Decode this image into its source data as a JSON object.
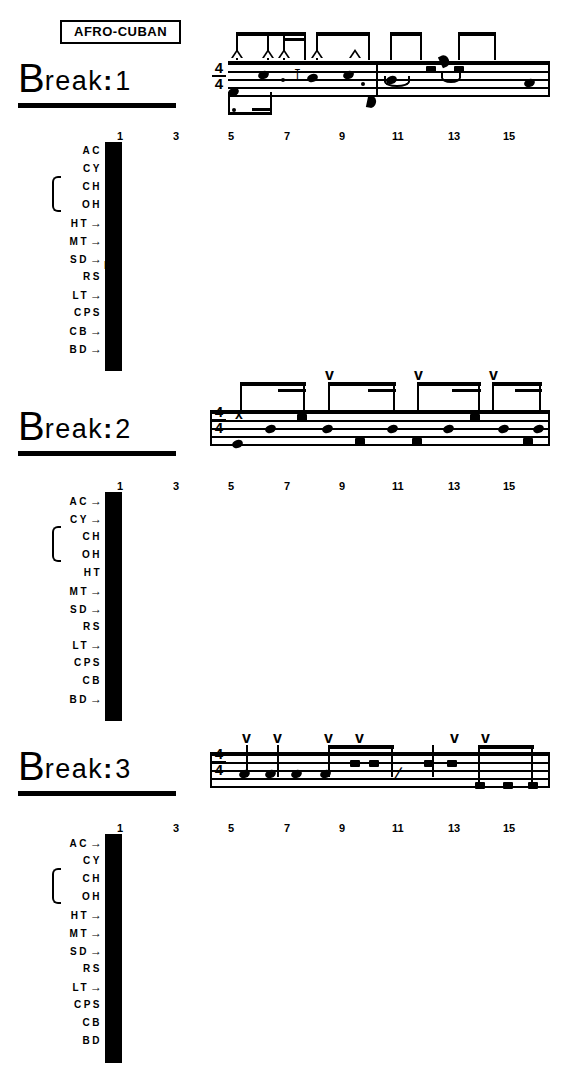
{
  "document": {
    "style_banner": "AFRO-CUBAN"
  },
  "grid": {
    "column_numbers": [
      "1",
      "3",
      "5",
      "7",
      "9",
      "11",
      "13",
      "15"
    ],
    "column_count": 16,
    "row_labels": [
      "AC",
      "CY",
      "CH",
      "OH",
      "HT",
      "MT",
      "SD",
      "RS",
      "LT",
      "CPS",
      "CB",
      "BD"
    ],
    "flam_marker": "F"
  },
  "breaks": [
    {
      "id": "break-1",
      "label_b": "B",
      "label_rest": "reak",
      "label_colon": ":",
      "label_number": "1",
      "time_signature": {
        "top": "4",
        "bottom": "4"
      },
      "rows": [
        {
          "label": "AC",
          "arrow": false,
          "cells": []
        },
        {
          "label": "CY",
          "arrow": false,
          "cells": []
        },
        {
          "label": "CH",
          "arrow": false,
          "cells": []
        },
        {
          "label": "OH",
          "arrow": false,
          "cells": []
        },
        {
          "label": "HT",
          "arrow": true,
          "cells": [
            13
          ],
          "flams": [
            13
          ]
        },
        {
          "label": "MT",
          "arrow": true,
          "cells": [
            11
          ]
        },
        {
          "label": "SD",
          "arrow": true,
          "cells": [
            4,
            7,
            9
          ],
          "flams": [
            9
          ]
        },
        {
          "label": "RS",
          "arrow": false,
          "cells": []
        },
        {
          "label": "LT",
          "arrow": true,
          "cells": [
            15
          ]
        },
        {
          "label": "CPS",
          "arrow": false,
          "cells": []
        },
        {
          "label": "CB",
          "arrow": true,
          "cells": [
            1,
            3,
            4,
            5,
            7
          ]
        },
        {
          "label": "BD",
          "arrow": true,
          "cells": [
            1
          ]
        }
      ]
    },
    {
      "id": "break-2",
      "label_b": "B",
      "label_rest": "reak",
      "label_colon": ":",
      "label_number": "2",
      "time_signature": {
        "top": "4",
        "bottom": "4"
      },
      "rows": [
        {
          "label": "AC",
          "arrow": true,
          "cells": [
            5,
            9,
            13
          ]
        },
        {
          "label": "CY",
          "arrow": true,
          "cells": [
            1
          ]
        },
        {
          "label": "CH",
          "arrow": false,
          "cells": []
        },
        {
          "label": "OH",
          "arrow": false,
          "cells": []
        },
        {
          "label": "HT",
          "arrow": false,
          "cells": []
        },
        {
          "label": "MT",
          "arrow": true,
          "cells": [
            4,
            11
          ]
        },
        {
          "label": "SD",
          "arrow": true,
          "cells": [
            3,
            5,
            8,
            11,
            13,
            16
          ]
        },
        {
          "label": "RS",
          "arrow": false,
          "cells": []
        },
        {
          "label": "LT",
          "arrow": true,
          "cells": [
            7,
            9,
            15
          ]
        },
        {
          "label": "CPS",
          "arrow": false,
          "cells": []
        },
        {
          "label": "CB",
          "arrow": false,
          "cells": []
        },
        {
          "label": "BD",
          "arrow": true,
          "cells": [
            1
          ]
        }
      ]
    },
    {
      "id": "break-3",
      "label_b": "B",
      "label_rest": "reak",
      "label_colon": ":",
      "label_number": "3",
      "time_signature": {
        "top": "4",
        "bottom": "4"
      },
      "rows": [
        {
          "label": "AC",
          "arrow": true,
          "cells": [
            1,
            4,
            5,
            7,
            11,
            13
          ]
        },
        {
          "label": "CY",
          "arrow": false,
          "cells": []
        },
        {
          "label": "CH",
          "arrow": false,
          "cells": []
        },
        {
          "label": "OH",
          "arrow": false,
          "cells": []
        },
        {
          "label": "HT",
          "arrow": true,
          "cells": [
            10,
            11
          ]
        },
        {
          "label": "MT",
          "arrow": true,
          "cells": [
            7,
            8
          ]
        },
        {
          "label": "SD",
          "arrow": true,
          "cells": [
            1,
            2,
            4,
            5
          ]
        },
        {
          "label": "RS",
          "arrow": false,
          "cells": []
        },
        {
          "label": "LT",
          "arrow": true,
          "cells": [
            13,
            14,
            16
          ]
        },
        {
          "label": "CPS",
          "arrow": false,
          "cells": []
        },
        {
          "label": "CB",
          "arrow": false,
          "cells": []
        },
        {
          "label": "BD",
          "arrow": false,
          "cells": []
        }
      ]
    }
  ],
  "notation": {
    "accent_triangle": "open-accent",
    "accent_v": "v",
    "xhead": "x",
    "rest_eighth": "♩"
  },
  "colors": {
    "ink": "#000000",
    "paper": "#ffffff"
  }
}
